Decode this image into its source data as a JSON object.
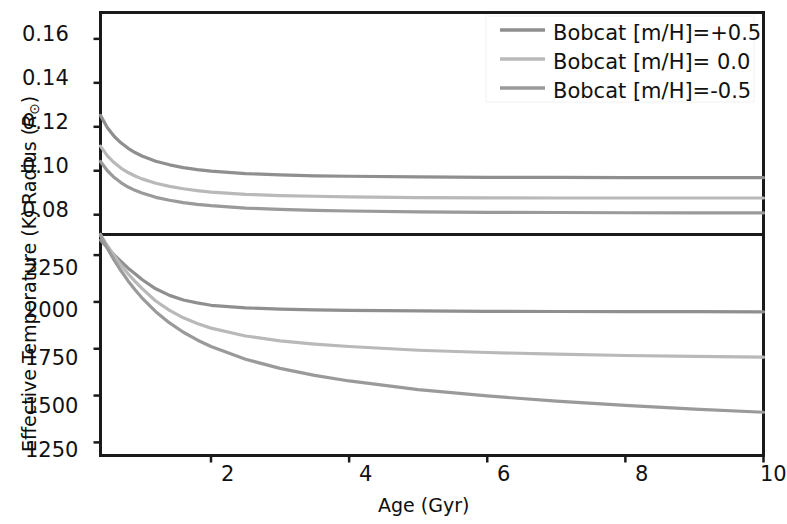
{
  "figure": {
    "xlabel": "Age (Gyr)",
    "panels": [
      {
        "id": "radius-panel",
        "ylabel_prefix": "Radius (",
        "ylabel_symbol": "R",
        "ylabel_subscript": "⊙",
        "ylabel_suffix": ")",
        "yticks": [
          "0.16",
          "0.14",
          "0.12",
          "0.10",
          "0.08"
        ]
      },
      {
        "id": "teff-panel",
        "ylabel": "Effective Temperature (K)",
        "yticks": [
          "2250",
          "2000",
          "1750",
          "1500",
          "1250"
        ]
      }
    ],
    "xticks": [
      "2",
      "4",
      "6",
      "8",
      "10"
    ],
    "legend": {
      "position": "upper right",
      "items": [
        {
          "label": "Bobcat [m/H]=+0.5",
          "color": "#8f8f8f"
        },
        {
          "label": "Bobcat [m/H]= 0.0",
          "color": "#b9b9b9"
        },
        {
          "label": "Bobcat [m/H]=-0.5",
          "color": "#9a9a9a"
        }
      ]
    }
  },
  "chart_data": [
    {
      "type": "line",
      "title": "",
      "xlabel": "Age (Gyr)",
      "ylabel": "Radius (R_sun)",
      "xlim": [
        0.4,
        10
      ],
      "ylim": [
        0.071,
        0.172
      ],
      "xticks": [
        2,
        4,
        6,
        8,
        10
      ],
      "yticks": [
        0.08,
        0.1,
        0.12,
        0.14,
        0.16
      ],
      "grid": false,
      "legend_position": "upper right",
      "x": [
        0.4,
        0.5,
        0.6,
        0.7,
        0.8,
        0.9,
        1.0,
        1.2,
        1.4,
        1.6,
        1.8,
        2.0,
        2.5,
        3.0,
        3.5,
        4.0,
        5.0,
        6.0,
        7.0,
        8.0,
        9.0,
        10.0
      ],
      "series": [
        {
          "name": "Bobcat [m/H]=+0.5",
          "color": "#8f8f8f",
          "values": [
            0.1252,
            0.1196,
            0.1156,
            0.1126,
            0.1102,
            0.1083,
            0.1067,
            0.1043,
            0.1027,
            0.1014,
            0.1005,
            0.0998,
            0.0987,
            0.0981,
            0.0977,
            0.0975,
            0.0972,
            0.097,
            0.097,
            0.0969,
            0.0969,
            0.0969
          ]
        },
        {
          "name": "Bobcat [m/H]= 0.0",
          "color": "#b9b9b9",
          "values": [
            0.1112,
            0.1068,
            0.1036,
            0.1011,
            0.0992,
            0.0976,
            0.0963,
            0.0943,
            0.0929,
            0.0918,
            0.091,
            0.0903,
            0.0893,
            0.0887,
            0.0884,
            0.0881,
            0.0878,
            0.0877,
            0.0876,
            0.0876,
            0.0876,
            0.0876
          ]
        },
        {
          "name": "Bobcat [m/H]=-0.5",
          "color": "#9a9a9a",
          "values": [
            0.1042,
            0.1,
            0.0969,
            0.0945,
            0.0926,
            0.0911,
            0.0899,
            0.0879,
            0.0866,
            0.0855,
            0.0847,
            0.0841,
            0.083,
            0.0824,
            0.082,
            0.0817,
            0.0813,
            0.0811,
            0.081,
            0.0809,
            0.0808,
            0.0808
          ]
        }
      ]
    },
    {
      "type": "line",
      "title": "",
      "xlabel": "Age (Gyr)",
      "ylabel": "Effective Temperature (K)",
      "xlim": [
        0.4,
        10
      ],
      "ylim": [
        1180,
        2360
      ],
      "xticks": [
        2,
        4,
        6,
        8,
        10
      ],
      "yticks": [
        1250,
        1500,
        1750,
        2000,
        2250
      ],
      "grid": false,
      "series": [
        {
          "name": "Bobcat [m/H]=+0.5",
          "color": "#8f8f8f",
          "values": [
            2330,
            2290,
            2250,
            2215,
            2180,
            2150,
            2120,
            2070,
            2035,
            2010,
            1995,
            1982,
            1968,
            1962,
            1958,
            1955,
            1952,
            1950,
            1949,
            1948,
            1948,
            1947
          ]
        },
        {
          "name": "Bobcat [m/H]= 0.0",
          "color": "#b9b9b9",
          "values": [
            2360,
            2300,
            2245,
            2195,
            2150,
            2110,
            2072,
            2005,
            1955,
            1915,
            1885,
            1860,
            1818,
            1792,
            1775,
            1762,
            1742,
            1730,
            1721,
            1714,
            1709,
            1705
          ]
        },
        {
          "name": "Bobcat [m/H]=-0.5",
          "color": "#9a9a9a",
          "values": [
            2355,
            2285,
            2222,
            2165,
            2112,
            2065,
            2022,
            1948,
            1888,
            1838,
            1797,
            1762,
            1694,
            1645,
            1608,
            1578,
            1532,
            1498,
            1470,
            1448,
            1428,
            1411
          ]
        }
      ]
    }
  ]
}
